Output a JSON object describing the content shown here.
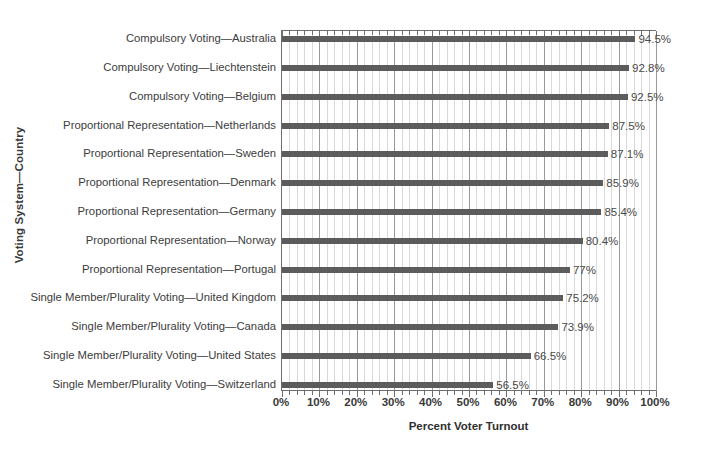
{
  "chart_data": {
    "type": "bar",
    "orientation": "horizontal",
    "title": "",
    "xlabel": "Percent Voter Turnout",
    "ylabel": "Voting System—Country",
    "xlim": [
      0,
      100
    ],
    "xtick_labels": [
      "0%",
      "10%",
      "20%",
      "30%",
      "40%",
      "50%",
      "60%",
      "70%",
      "80%",
      "90%",
      "100%"
    ],
    "xtick_values": [
      0,
      10,
      20,
      30,
      40,
      50,
      60,
      70,
      80,
      90,
      100
    ],
    "minor_gridlines_step": 2,
    "grid": true,
    "legend": "none",
    "bar_color": "#5c5c5c",
    "categories": [
      "Compulsory Voting—Australia",
      "Compulsory Voting—Liechtenstein",
      "Compulsory Voting—Belgium",
      "Proportional Representation—Netherlands",
      "Proportional Representation—Sweden",
      "Proportional Representation—Denmark",
      "Proportional Representation—Germany",
      "Proportional Representation—Norway",
      "Proportional Representation—Portugal",
      "Single Member/Plurality Voting—United Kingdom",
      "Single Member/Plurality Voting—Canada",
      "Single Member/Plurality Voting—United States",
      "Single Member/Plurality Voting—Switzerland"
    ],
    "values": [
      94.5,
      92.8,
      92.5,
      87.5,
      87.1,
      85.9,
      85.4,
      80.4,
      77,
      75.2,
      73.9,
      66.5,
      56.5
    ],
    "value_labels": [
      "94.5%",
      "92.8%",
      "92.5%",
      "87.5%",
      "87.1%",
      "85.9%",
      "85.4%",
      "80.4%",
      "77%",
      "75.2%",
      "73.9%",
      "66.5%",
      "56.5%"
    ]
  }
}
